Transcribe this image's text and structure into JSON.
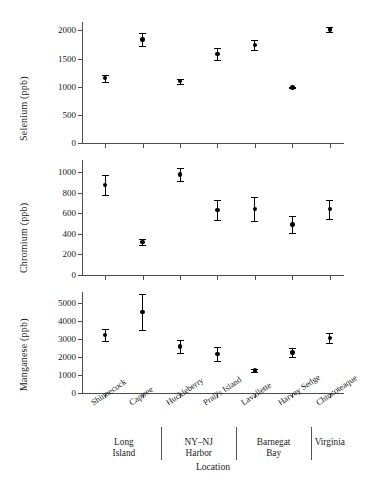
{
  "chart_data": {
    "type": "scatter",
    "title": "",
    "xlabel": "Location",
    "categories": [
      "Shinnecock",
      "Captree",
      "Huckleberry",
      "Prall's Island",
      "Lavallette",
      "Harvey Sedge",
      "Chincoteaque"
    ],
    "groups": [
      {
        "label_line1": "Long",
        "label_line2": "Island",
        "members": [
          "Shinnecock",
          "Captree"
        ]
      },
      {
        "label_line1": "NY–NJ",
        "label_line2": "Harbor",
        "members": [
          "Huckleberry",
          "Prall's Island"
        ]
      },
      {
        "label_line1": "Barnegat",
        "label_line2": "Bay",
        "members": [
          "Lavallette",
          "Harvey Sedge"
        ]
      },
      {
        "label_line1": "Virginia",
        "label_line2": "",
        "members": [
          "Chincoteaque"
        ]
      }
    ],
    "panels": [
      {
        "ylabel": "Selenium (ppb)",
        "ylim": [
          0,
          2150
        ],
        "yticks": [
          0,
          500,
          1000,
          1500,
          2000
        ],
        "ytick_labels": [
          "0",
          "500",
          "1000",
          "1500",
          "2000"
        ],
        "values": [
          1150,
          1840,
          1100,
          1580,
          1740,
          985,
          2020
        ],
        "err_low": [
          60,
          110,
          45,
          105,
          90,
          15,
          50
        ],
        "err_high": [
          60,
          110,
          45,
          105,
          90,
          15,
          50
        ]
      },
      {
        "ylabel": "Chromium (ppb)",
        "ylim": [
          0,
          1120
        ],
        "yticks": [
          0,
          200,
          400,
          600,
          800,
          1000
        ],
        "ytick_labels": [
          "0",
          "200",
          "400",
          "600",
          "800",
          "1000"
        ],
        "values": [
          875,
          320,
          980,
          635,
          640,
          490,
          640
        ],
        "err_low": [
          95,
          30,
          65,
          95,
          115,
          80,
          90
        ],
        "err_high": [
          95,
          30,
          65,
          95,
          115,
          80,
          90
        ]
      },
      {
        "ylabel": "Manganese (ppb)",
        "ylim": [
          0,
          5600
        ],
        "yticks": [
          0,
          1000,
          2000,
          3000,
          4000,
          5000
        ],
        "ytick_labels": [
          "0",
          "1000",
          "2000",
          "3000",
          "4000",
          "5000"
        ],
        "values": [
          3200,
          4500,
          2580,
          2150,
          1250,
          2250,
          3060
        ],
        "err_low": [
          330,
          990,
          380,
          400,
          80,
          250,
          270
        ],
        "err_high": [
          330,
          990,
          380,
          400,
          80,
          250,
          270
        ]
      }
    ],
    "grid": false,
    "legend": null,
    "marker": "filled-circle",
    "errorbar_style": "capped"
  }
}
